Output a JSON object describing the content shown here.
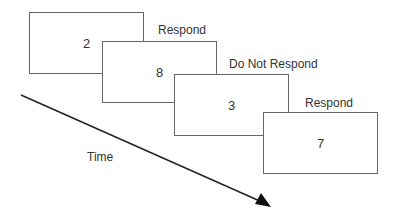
{
  "diagram": {
    "trials": [
      {
        "digit": "2",
        "response": "Respond"
      },
      {
        "digit": "8",
        "response": "Do Not Respond"
      },
      {
        "digit": "3",
        "response": "Respond"
      },
      {
        "digit": "7",
        "response": ""
      }
    ],
    "time_label": "Time"
  }
}
